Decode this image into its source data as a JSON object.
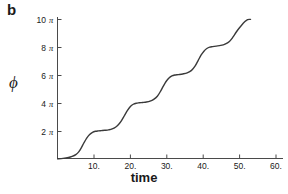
{
  "panel": {
    "label": "b"
  },
  "chart_data": {
    "type": "line",
    "title": "",
    "xlabel": "time",
    "ylabel": "ϕ",
    "xlim": [
      0,
      62
    ],
    "ylim": [
      0,
      32.5
    ],
    "grid": false,
    "legend": null,
    "xticks": [
      10,
      20,
      30,
      40,
      50,
      60
    ],
    "xticklabels": [
      "10.",
      "20.",
      "30.",
      "40.",
      "50.",
      "60."
    ],
    "yticks": [
      6.2832,
      12.5664,
      18.8496,
      25.1327,
      31.4159
    ],
    "yticklabels": [
      "2 π",
      "4 π",
      "6 π",
      "8 π",
      "10 π"
    ],
    "yticklabel_numbers": [
      "2",
      "4",
      "6",
      "8",
      "10"
    ],
    "yticklabel_unit": "π",
    "series": [
      {
        "name": "phase",
        "color": "#3a3a3a",
        "description": "devil's staircase: phase advances by 2 pi per step with plateaus between steps",
        "x": [
          0.0,
          1.5,
          3.0,
          4.0,
          5.0,
          5.8,
          6.5,
          7.2,
          8.0,
          8.8,
          9.6,
          10.4,
          11.2,
          12.0,
          13.0,
          14.0,
          15.0,
          16.0,
          16.8,
          17.6,
          18.4,
          19.2,
          20.0,
          20.8,
          21.6,
          22.4,
          23.4,
          24.4,
          25.4,
          26.4,
          27.4,
          28.2,
          29.0,
          29.8,
          30.6,
          31.4,
          32.2,
          33.2,
          34.4,
          35.6,
          36.8,
          37.8,
          38.6,
          39.4,
          40.2,
          41.0,
          41.8,
          42.6,
          43.6,
          44.8,
          46.0,
          47.2,
          48.2,
          49.0,
          49.8,
          50.6,
          51.4,
          52.2,
          53.0
        ],
        "y": [
          0.15,
          0.25,
          0.45,
          0.7,
          1.1,
          1.7,
          2.6,
          3.7,
          4.8,
          5.6,
          6.1,
          6.33,
          6.42,
          6.48,
          6.55,
          6.65,
          6.85,
          7.3,
          7.9,
          8.8,
          9.9,
          11.0,
          11.9,
          12.4,
          12.63,
          12.72,
          12.8,
          12.9,
          13.1,
          13.5,
          14.2,
          15.2,
          16.4,
          17.5,
          18.3,
          18.75,
          18.95,
          19.05,
          19.2,
          19.45,
          20.0,
          21.0,
          22.2,
          23.4,
          24.3,
          24.9,
          25.2,
          25.32,
          25.45,
          25.6,
          25.9,
          26.5,
          27.5,
          28.5,
          29.4,
          30.2,
          30.9,
          31.4,
          31.45
        ]
      }
    ],
    "plateaus": [
      {
        "level_label": "2 π",
        "t_start": 11,
        "t_end": 16
      },
      {
        "level_label": "4 π",
        "t_start": 21,
        "t_end": 26
      },
      {
        "level_label": "6 π",
        "t_start": 32,
        "t_end": 37
      },
      {
        "level_label": "8 π",
        "t_start": 43,
        "t_end": 48
      }
    ]
  }
}
